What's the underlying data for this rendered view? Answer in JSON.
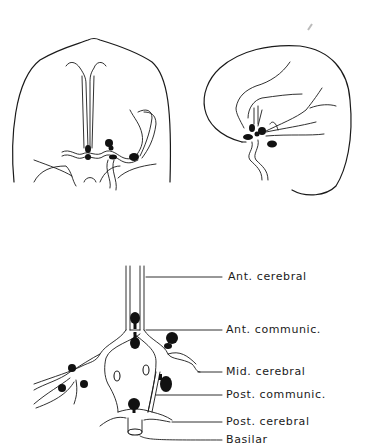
{
  "figure": {
    "panels": [
      {
        "name": "frontal-view",
        "description": "Frontal view of brain with aneurysms at circle of Willis"
      },
      {
        "name": "lateral-view",
        "description": "Lateral view of brain with aneurysms at circle of Willis"
      },
      {
        "name": "circle-of-willis-schematic",
        "description": "Schematic of circle of Willis with aneurysm sites"
      }
    ],
    "labels": [
      {
        "id": "ant-cerebral",
        "text": "Ant. cerebral"
      },
      {
        "id": "ant-communic",
        "text": "Ant. communic."
      },
      {
        "id": "mid-cerebral",
        "text": "Mid. cerebral"
      },
      {
        "id": "post-communic",
        "text": "Post. communic."
      },
      {
        "id": "post-cerebral",
        "text": "Post. cerebral"
      },
      {
        "id": "basilar",
        "text": "Basilar"
      }
    ],
    "colors": {
      "line": "#1a1a1a",
      "aneurysm": "#111111",
      "background": "#ffffff"
    }
  }
}
